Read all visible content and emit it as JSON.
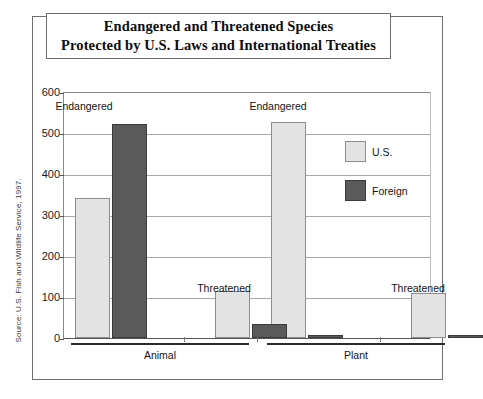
{
  "figure": {
    "title_line1": "Endangered and Threatened Species",
    "title_line2": "Protected by U.S. Laws and International Treaties",
    "source_note": "Source: U.S. Fish and Wildlife Service, 1997."
  },
  "legend": {
    "position": "right-inside",
    "items": [
      {
        "label": "U.S.",
        "color": "#e3e3e3",
        "name": "us"
      },
      {
        "label": "Foreign",
        "color": "#5a5a5a",
        "name": "foreign"
      }
    ]
  },
  "axis": {
    "y_ticks": [
      600,
      500,
      400,
      300,
      200,
      100,
      0
    ],
    "y_min": 0,
    "y_max": 600,
    "grid": true
  },
  "groups": [
    {
      "label": "Animal"
    },
    {
      "label": "Plant"
    }
  ],
  "series_labels": [
    {
      "text": "Endangered",
      "group": "Animal"
    },
    {
      "text": "Threatened",
      "group": "Animal"
    },
    {
      "text": "Endangered",
      "group": "Plant"
    },
    {
      "text": "Threatened",
      "group": "Plant"
    }
  ],
  "chart_data": {
    "type": "bar",
    "title": "Endangered and Threatened Species Protected by U.S. Laws and International Treaties",
    "xlabel": "",
    "ylabel": "",
    "ylim": [
      0,
      600
    ],
    "yticks": [
      0,
      100,
      200,
      300,
      400,
      500,
      600
    ],
    "grid": true,
    "legend_position": "right-inside",
    "categories": [
      "Animal - Endangered",
      "Animal - Threatened",
      "Plant - Endangered",
      "Plant - Threatened"
    ],
    "group_labels": [
      "Animal",
      "Plant"
    ],
    "series": [
      {
        "name": "U.S.",
        "color": "#e3e3e3",
        "values": [
          342,
          115,
          528,
          110
        ]
      },
      {
        "name": "Foreign",
        "color": "#5a5a5a",
        "values": [
          521,
          33,
          1,
          2
        ]
      }
    ],
    "annotations": [
      "Endangered",
      "Threatened",
      "Endangered",
      "Threatened"
    ],
    "source": "Source: U.S. Fish and Wildlife Service, 1997."
  }
}
